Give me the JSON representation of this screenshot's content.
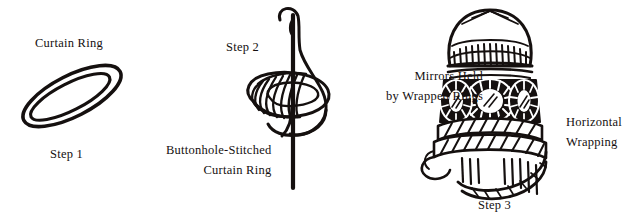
{
  "diagram": {
    "background_color": "#ffffff",
    "ink_color": "#15100f",
    "steps": [
      {
        "id": "step1",
        "caption": "Step 1",
        "label": "Curtain Ring",
        "figure_name": "curtain-ring-illustration"
      },
      {
        "id": "step2",
        "caption": "Step 2",
        "label_line1": "Buttonhole-Stitched",
        "label_line2": "Curtain Ring",
        "figure_name": "needle-and-stitched-ring-illustration"
      },
      {
        "id": "step3",
        "caption": "Step 3",
        "label_a_line1": "Mirrors Held",
        "label_a_line2": "by Wrapped Rings",
        "label_b_line1": "Horizontal",
        "label_b_line2": "Wrapping",
        "figure_name": "mirrored-tassel-illustration"
      }
    ]
  }
}
